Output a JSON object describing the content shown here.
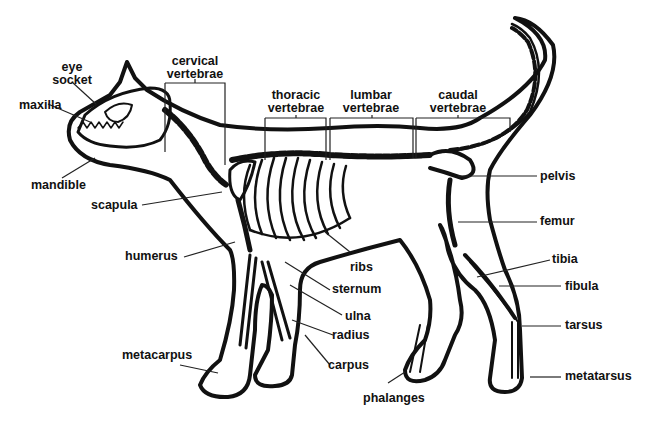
{
  "diagram": {
    "style": "black line art on white",
    "colors": {
      "ink": "#111111",
      "background": "#ffffff"
    },
    "labels": {
      "eye_socket": {
        "line1": "eye",
        "line2": "socket"
      },
      "maxilla": "maxilla",
      "mandible": "mandible",
      "cervical_vertebrae": {
        "line1": "cervical",
        "line2": "vertebrae"
      },
      "thoracic_vertebrae": {
        "line1": "thoracic",
        "line2": "vertebrae"
      },
      "lumbar_vertebrae": {
        "line1": "lumbar",
        "line2": "vertebrae"
      },
      "caudal_vertebrae": {
        "line1": "caudal",
        "line2": "vertebrae"
      },
      "scapula": "scapula",
      "humerus": "humerus",
      "ribs": "ribs",
      "sternum": "sternum",
      "ulna": "ulna",
      "radius": "radius",
      "carpus": "carpus",
      "metacarpus": "metacarpus",
      "phalanges": "phalanges",
      "pelvis": "pelvis",
      "femur": "femur",
      "tibia": "tibia",
      "fibula": "fibula",
      "tarsus": "tarsus",
      "metatarsus": "metatarsus"
    }
  }
}
